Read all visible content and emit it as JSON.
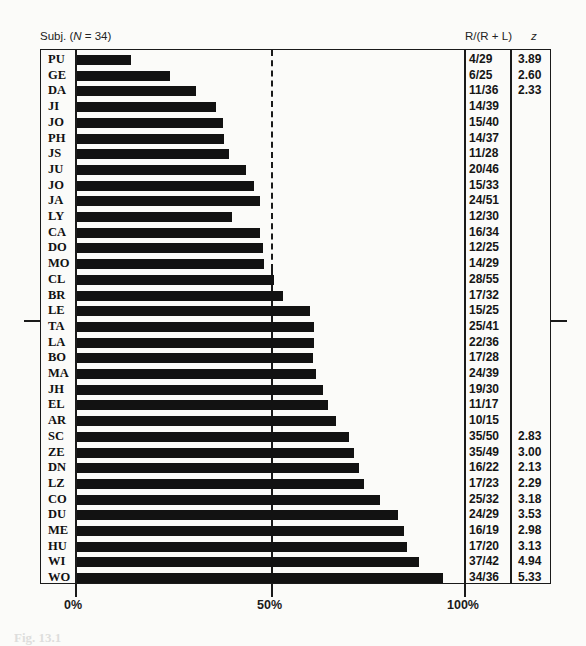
{
  "header": {
    "subj_prefix": "Subj. (",
    "subj_n_var": "N",
    "subj_suffix": " = 34)",
    "ratio_header": "R/(R + L)",
    "z_header": "z"
  },
  "axis": {
    "ticks": [
      "0%",
      "50%",
      "100%"
    ]
  },
  "caption": "Fig. 13.1",
  "chart_data": {
    "type": "bar",
    "orientation": "horizontal",
    "title": "Subj. (N = 34)",
    "xlabel": "",
    "ylabel": "Subject",
    "xlim": [
      0,
      100
    ],
    "x_ticks": [
      "0%",
      "50%",
      "100%"
    ],
    "reference_line": {
      "x": 50,
      "style": "dashed above CL, solid below"
    },
    "grid": false,
    "legend": null,
    "columns": [
      "Subject",
      "R/(R + L)",
      "z"
    ],
    "categories": [
      "PU",
      "GE",
      "DA",
      "JI",
      "JO",
      "PH",
      "JS",
      "JU",
      "JO",
      "JA",
      "LY",
      "CA",
      "DO",
      "MO",
      "CL",
      "BR",
      "LE",
      "TA",
      "LA",
      "BO",
      "MA",
      "JH",
      "EL",
      "AR",
      "SC",
      "ZE",
      "DN",
      "LZ",
      "CO",
      "DU",
      "ME",
      "HU",
      "WI",
      "WO"
    ],
    "ratios": [
      "4/29",
      "6/25",
      "11/36",
      "14/39",
      "15/40",
      "14/37",
      "11/28",
      "20/46",
      "15/33",
      "24/51",
      "12/30",
      "16/34",
      "12/25",
      "14/29",
      "28/55",
      "17/32",
      "15/25",
      "25/41",
      "22/36",
      "17/28",
      "24/39",
      "19/30",
      "11/17",
      "10/15",
      "35/50",
      "35/49",
      "16/22",
      "17/23",
      "25/32",
      "24/29",
      "16/19",
      "17/20",
      "37/42",
      "34/36"
    ],
    "values": [
      13.8,
      24.0,
      30.6,
      35.9,
      37.5,
      37.8,
      39.3,
      43.5,
      45.5,
      47.1,
      40.0,
      47.1,
      48.0,
      48.3,
      50.9,
      53.1,
      60.0,
      61.0,
      61.1,
      60.7,
      61.5,
      63.3,
      64.7,
      66.7,
      70.0,
      71.4,
      72.7,
      73.9,
      78.1,
      82.8,
      84.2,
      85.0,
      88.1,
      94.4
    ],
    "z": [
      "3.89",
      "2.60",
      "2.33",
      "",
      "",
      "",
      "",
      "",
      "",
      "",
      "",
      "",
      "",
      "",
      "",
      "",
      "",
      "",
      "",
      "",
      "",
      "",
      "",
      "",
      "2.83",
      "3.00",
      "2.13",
      "2.29",
      "3.18",
      "3.53",
      "2.98",
      "3.13",
      "4.94",
      "5.33"
    ]
  }
}
